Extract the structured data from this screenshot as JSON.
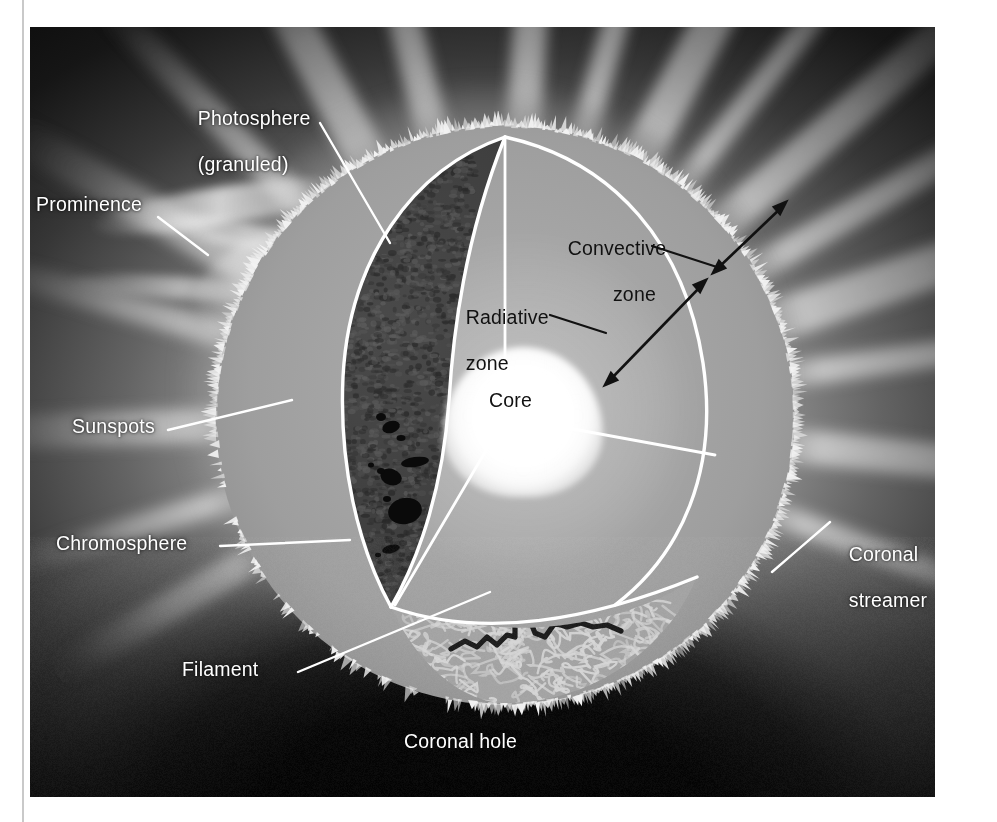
{
  "figure": {
    "background_color": "#0b0b0b",
    "sphere_color": "#a4a4a4",
    "line_color": "#ffffff",
    "core_color": "#ffffff"
  },
  "labels": {
    "photosphere": {
      "line1": "Photosphere",
      "line2": "(granuled)"
    },
    "prominence": "Prominence",
    "sunspots": "Sunspots",
    "chromosphere": "Chromosphere",
    "filament": "Filament",
    "coronal_hole": "Coronal hole",
    "coronal_streamer": {
      "line1": "Coronal",
      "line2": "streamer"
    },
    "convective_zone": {
      "line1": "Convective",
      "line2": "zone"
    },
    "radiative_zone": {
      "line1": "Radiative",
      "line2": "zone"
    },
    "core": "Core"
  },
  "layers": [
    {
      "name": "core",
      "label": "Core",
      "region": "innermost"
    },
    {
      "name": "radiative-zone",
      "label": "Radiative zone",
      "region": "middle"
    },
    {
      "name": "convective-zone",
      "label": "Convective zone",
      "region": "outer"
    },
    {
      "name": "photosphere",
      "label": "Photosphere (granuled)",
      "region": "surface"
    },
    {
      "name": "chromosphere",
      "label": "Chromosphere",
      "region": "atmosphere"
    },
    {
      "name": "corona",
      "label": "Coronal streamer",
      "region": "atmosphere"
    }
  ],
  "surface_features": [
    {
      "name": "sunspots",
      "label": "Sunspots"
    },
    {
      "name": "filament",
      "label": "Filament"
    },
    {
      "name": "prominence",
      "label": "Prominence"
    },
    {
      "name": "coronal-hole",
      "label": "Coronal hole"
    }
  ]
}
